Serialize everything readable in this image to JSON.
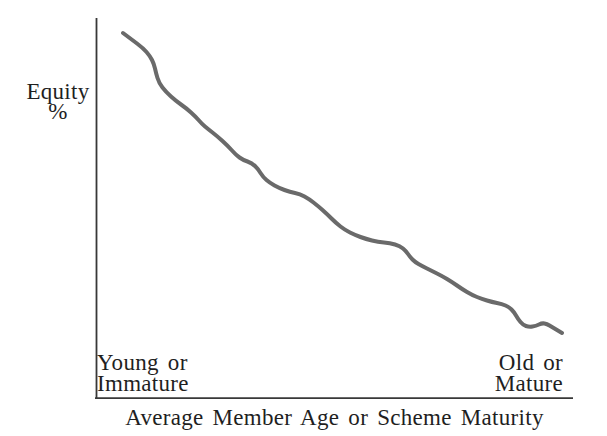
{
  "figure": {
    "y_axis_label_line1": "Equity",
    "y_axis_label_line2": "%",
    "x_axis_label": "Average Member Age or Scheme Maturity",
    "left_annotation_line1": "Young or",
    "left_annotation_line2": "Immature",
    "right_annotation_line1": "Old or",
    "right_annotation_line2": "Mature"
  },
  "colors": {
    "background": "#ffffff",
    "curve": "#6a6a6a",
    "axis": "#383838",
    "text": "#1f1f1f"
  },
  "chart_data": {
    "type": "line",
    "title": "",
    "xlabel": "Average Member Age or Scheme Maturity",
    "ylabel": "Equity %",
    "x_start_annotation": "Young or Immature",
    "x_end_annotation": "Old or Mature",
    "axes_numeric": false,
    "grid": false,
    "legend": "none",
    "trend": "Equity % declines in an irregular, stepped curve as average member age / scheme maturity increases",
    "curve_stroke_width_px": 4,
    "axis": {
      "y_axis_px": {
        "x": 96,
        "y_top": 18,
        "y_bottom": 399
      },
      "x_axis_px": {
        "y": 398,
        "x_left": 95,
        "x_right": 573
      }
    },
    "series": [
      {
        "name": "Equity %",
        "points_px": [
          [
            123,
            33
          ],
          [
            131,
            39
          ],
          [
            143,
            48
          ],
          [
            150,
            56
          ],
          [
            154,
            64
          ],
          [
            156,
            73
          ],
          [
            159,
            83
          ],
          [
            166,
            92
          ],
          [
            176,
            101
          ],
          [
            186,
            108
          ],
          [
            196,
            117
          ],
          [
            202,
            124
          ],
          [
            208,
            129
          ],
          [
            217,
            136
          ],
          [
            228,
            146
          ],
          [
            236,
            155
          ],
          [
            243,
            160
          ],
          [
            252,
            163
          ],
          [
            258,
            169
          ],
          [
            263,
            177
          ],
          [
            270,
            183
          ],
          [
            279,
            188
          ],
          [
            290,
            192
          ],
          [
            300,
            194
          ],
          [
            309,
            199
          ],
          [
            318,
            206
          ],
          [
            327,
            214
          ],
          [
            336,
            223
          ],
          [
            345,
            230
          ],
          [
            355,
            235
          ],
          [
            366,
            239
          ],
          [
            378,
            242
          ],
          [
            390,
            243
          ],
          [
            400,
            246
          ],
          [
            406,
            251
          ],
          [
            410,
            257
          ],
          [
            415,
            262
          ],
          [
            422,
            266
          ],
          [
            432,
            271
          ],
          [
            442,
            276
          ],
          [
            452,
            282
          ],
          [
            462,
            289
          ],
          [
            472,
            295
          ],
          [
            482,
            299
          ],
          [
            492,
            302
          ],
          [
            502,
            304
          ],
          [
            509,
            307
          ],
          [
            514,
            312
          ],
          [
            518,
            319
          ],
          [
            523,
            325
          ],
          [
            529,
            327
          ],
          [
            536,
            326
          ],
          [
            542,
            323
          ],
          [
            547,
            324
          ],
          [
            552,
            327
          ],
          [
            557,
            330
          ],
          [
            562,
            333
          ]
        ]
      }
    ]
  }
}
